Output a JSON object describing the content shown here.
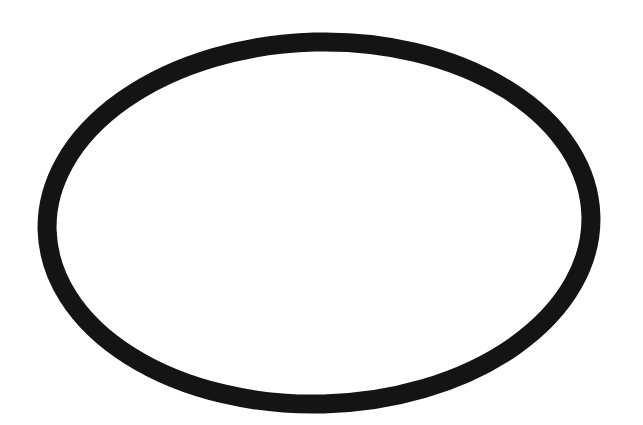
{
  "canvas": {
    "width": 643,
    "height": 425,
    "background": "#ffffff"
  },
  "shape": {
    "type": "ellipse-outline",
    "cx": 319,
    "cy": 223,
    "rx": 272,
    "ry": 181,
    "rotation_deg": -1.5,
    "stroke_color": "#141414",
    "stroke_width": 19,
    "fill": "none"
  }
}
